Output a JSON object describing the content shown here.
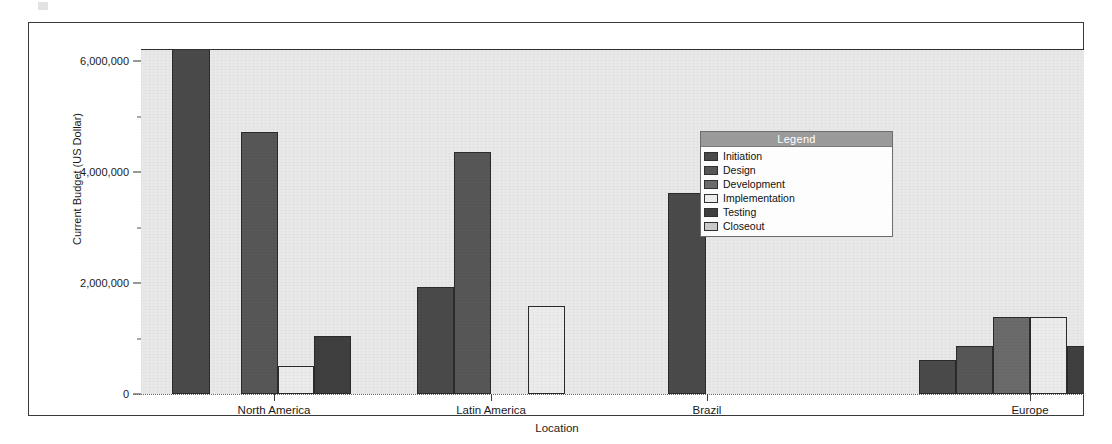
{
  "chart_data": {
    "type": "bar",
    "title": "",
    "xlabel": "Location",
    "ylabel": "Current Budget (US Dollar)",
    "categories": [
      "North America",
      "Latin America",
      "Brazil",
      "Europe"
    ],
    "ylim": [
      0,
      6200000
    ],
    "yticks": [
      0,
      2000000,
      4000000,
      6000000
    ],
    "ytick_labels": [
      "0",
      "2,000,000",
      "4,000,000",
      "6,000,000"
    ],
    "grid": true,
    "legend_position": "center-right",
    "legend_title": "Legend",
    "series": [
      {
        "name": "Initiation",
        "color": "#4a4a4a",
        "values": [
          6200000,
          1930000,
          3630000,
          620000
        ]
      },
      {
        "name": "Design",
        "color": "#575757",
        "values": [
          4730000,
          4370000,
          null,
          860000
        ]
      },
      {
        "name": "Development",
        "color": "#6b6b6b",
        "values": [
          null,
          null,
          null,
          1380000
        ]
      },
      {
        "name": "Implementation",
        "color": "#ececec",
        "values": [
          510000,
          1580000,
          null,
          1380000
        ]
      },
      {
        "name": "Testing",
        "color": "#3f3f3f",
        "values": [
          1040000,
          null,
          null,
          860000
        ]
      },
      {
        "name": "Closeout",
        "color": "#c9c9c9",
        "values": [
          null,
          null,
          null,
          null
        ]
      }
    ],
    "notes": [
      "First North America bar is clipped at the top of the plot area (value exceeds 6,000,000 axis maximum)."
    ]
  },
  "axis": {
    "y_title": "Current Budget (US Dollar)",
    "x_title": "Location",
    "ytick_labels": [
      "6,000,000",
      "4,000,000",
      "2,000,000",
      "0"
    ],
    "xcat_labels": [
      "North America",
      "Latin America",
      "Brazil",
      "Europe"
    ]
  },
  "legend": {
    "title": "Legend",
    "items": [
      {
        "label": "Initiation",
        "color": "#4a4a4a"
      },
      {
        "label": "Design",
        "color": "#575757"
      },
      {
        "label": "Development",
        "color": "#6b6b6b"
      },
      {
        "label": "Implementation",
        "color": "#ececec"
      },
      {
        "label": "Testing",
        "color": "#3f3f3f"
      },
      {
        "label": "Closeout",
        "color": "#c9c9c9"
      }
    ]
  },
  "bars": [
    {
      "name": "bar-north-america-initiation",
      "group": "North America",
      "series": "Initiation",
      "value": 6200000,
      "color": "#4a4a4a",
      "left": 143,
      "width": 38,
      "clipped": true
    },
    {
      "name": "bar-north-america-design",
      "group": "North America",
      "series": "Design",
      "value": 4730000,
      "color": "#575757",
      "left": 212,
      "width": 37,
      "clipped": false
    },
    {
      "name": "bar-north-america-implementation",
      "group": "North America",
      "series": "Implementation",
      "value": 510000,
      "color": "#ececec",
      "left": 249,
      "width": 36,
      "clipped": false
    },
    {
      "name": "bar-north-america-testing",
      "group": "North America",
      "series": "Testing",
      "value": 1040000,
      "color": "#3f3f3f",
      "left": 285,
      "width": 37,
      "clipped": false
    },
    {
      "name": "bar-latin-america-initiation",
      "group": "Latin America",
      "series": "Initiation",
      "value": 1930000,
      "color": "#4a4a4a",
      "left": 388,
      "width": 37,
      "clipped": false
    },
    {
      "name": "bar-latin-america-design",
      "group": "Latin America",
      "series": "Design",
      "value": 4370000,
      "color": "#575757",
      "left": 425,
      "width": 37,
      "clipped": false
    },
    {
      "name": "bar-latin-america-implementation",
      "group": "Latin America",
      "series": "Implementation",
      "value": 1580000,
      "color": "#ececec",
      "left": 499,
      "width": 37,
      "clipped": false
    },
    {
      "name": "bar-brazil-initiation",
      "group": "Brazil",
      "series": "Initiation",
      "value": 3630000,
      "color": "#4a4a4a",
      "left": 639,
      "width": 38,
      "clipped": false
    },
    {
      "name": "bar-europe-initiation",
      "group": "Europe",
      "series": "Initiation",
      "value": 620000,
      "color": "#4a4a4a",
      "left": 890,
      "width": 37,
      "clipped": false
    },
    {
      "name": "bar-europe-design",
      "group": "Europe",
      "series": "Design",
      "value": 860000,
      "color": "#575757",
      "left": 927,
      "width": 37,
      "clipped": false
    },
    {
      "name": "bar-europe-development",
      "group": "Europe",
      "series": "Development",
      "value": 1380000,
      "color": "#6b6b6b",
      "left": 964,
      "width": 37,
      "clipped": false
    },
    {
      "name": "bar-europe-implementation",
      "group": "Europe",
      "series": "Implementation",
      "value": 1380000,
      "color": "#ececec",
      "left": 1001,
      "width": 37,
      "clipped": false
    },
    {
      "name": "bar-europe-testing",
      "group": "Europe",
      "series": "Testing",
      "value": 860000,
      "color": "#3f3f3f",
      "left": 1038,
      "width": 37,
      "clipped": false
    }
  ],
  "xcat_ticks": [
    {
      "label": "North America",
      "x": 245
    },
    {
      "label": "Latin America",
      "x": 462
    },
    {
      "label": "Brazil",
      "x": 678
    },
    {
      "label": "Europe",
      "x": 1001
    }
  ]
}
